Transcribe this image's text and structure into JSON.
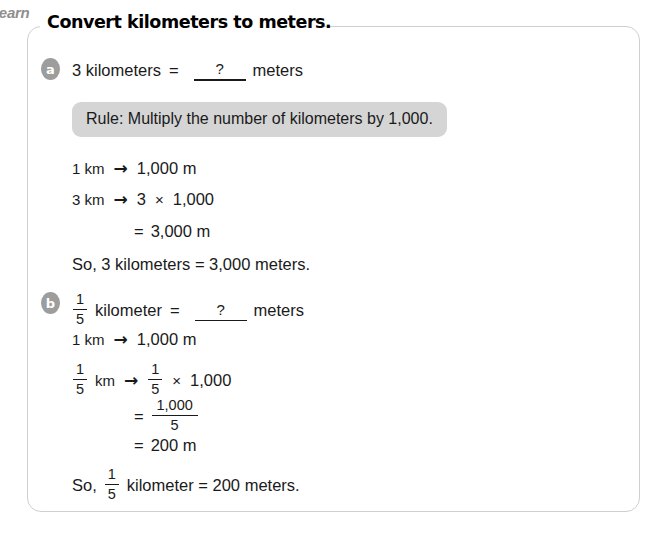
{
  "tab": {
    "label": "Learn"
  },
  "header": {
    "title": "Convert kilometers to meters."
  },
  "colors": {
    "panel_border": "#cfcfcf",
    "rule_box_bg": "#d5d5d5",
    "bullet_bg": "#9d9d9d",
    "text": "#1a1a1a",
    "tab_text": "#8e8e8e"
  },
  "rule_box": {
    "text": "Rule: Multiply the number of kilometers by 1,000."
  },
  "parts": {
    "a": {
      "marker": "a",
      "question": {
        "quantity": "3 kilometers",
        "equals": "=",
        "blank": "?",
        "unit": "meters"
      },
      "steps": {
        "line1": {
          "left": "1 km",
          "arrow": "→",
          "right": "1,000 m"
        },
        "line2": {
          "left": "3 km",
          "arrow": "→",
          "factor": "3",
          "times": "×",
          "value": "1,000"
        },
        "line3": {
          "equals": "=",
          "result": "3,000 m"
        }
      },
      "conclusion": "So, 3 kilometers = 3,000 meters."
    },
    "b": {
      "marker": "b",
      "question": {
        "fraction": {
          "numerator": "1",
          "denominator": "5"
        },
        "unit_word": "kilometer",
        "equals": "=",
        "blank": "?",
        "unit": "meters"
      },
      "steps": {
        "line1": {
          "left": "1 km",
          "arrow": "→",
          "right": "1,000 m"
        },
        "line2": {
          "fraction": {
            "numerator": "1",
            "denominator": "5"
          },
          "unit": "km",
          "arrow": "→",
          "fraction2": {
            "numerator": "1",
            "denominator": "5"
          },
          "times": "×",
          "value": "1,000"
        },
        "line3": {
          "equals": "=",
          "fraction": {
            "numerator": "1,000",
            "denominator": "5"
          }
        },
        "line4": {
          "equals": "=",
          "result": "200 m"
        }
      },
      "conclusion": {
        "prefix": "So,",
        "fraction": {
          "numerator": "1",
          "denominator": "5"
        },
        "middle": "kilometer = 200 meters."
      }
    }
  }
}
